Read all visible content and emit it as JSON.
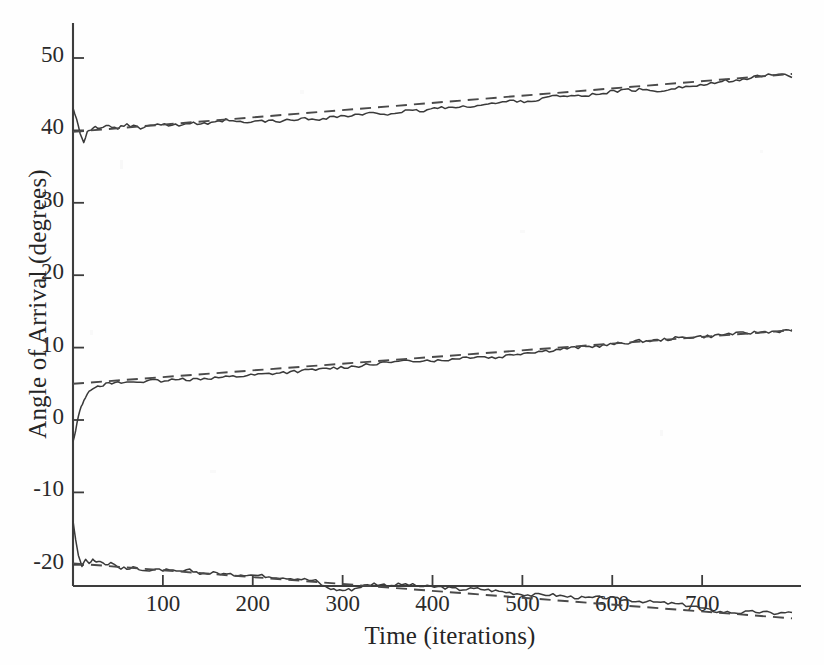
{
  "chart_data": {
    "type": "line",
    "title": "",
    "xlabel": "Time (iterations)",
    "ylabel": "Angle of Arrival (degrees)",
    "xlim": [
      0,
      810
    ],
    "ylim": [
      -30,
      54
    ],
    "grid": false,
    "legend": "none",
    "xticks": [
      100,
      200,
      300,
      400,
      500,
      600,
      700
    ],
    "yticks": [
      50,
      40,
      30,
      20,
      10,
      0,
      -10,
      -20
    ],
    "series": [
      {
        "name": "source-1-estimate",
        "style": "solid",
        "color": "#3a3a3a",
        "x": [
          0,
          4,
          8,
          12,
          16,
          20,
          25,
          30,
          40,
          50,
          60,
          75,
          90,
          110,
          130,
          150,
          170,
          190,
          210,
          230,
          250,
          270,
          290,
          310,
          330,
          350,
          370,
          390,
          410,
          430,
          450,
          470,
          490,
          510,
          530,
          550,
          570,
          590,
          610,
          630,
          650,
          670,
          690,
          710,
          730,
          750,
          770,
          785,
          800
        ],
        "y": [
          43.0,
          41.6,
          39.6,
          38.4,
          39.8,
          40.0,
          40.5,
          40.2,
          40.6,
          40.3,
          40.8,
          40.4,
          40.9,
          40.7,
          41.0,
          40.8,
          41.4,
          41.0,
          41.3,
          41.2,
          41.6,
          41.5,
          41.9,
          42.0,
          42.3,
          42.3,
          42.6,
          42.7,
          43.2,
          43.1,
          43.5,
          43.7,
          44.1,
          44.0,
          44.6,
          44.9,
          44.7,
          45.2,
          45.5,
          45.6,
          45.4,
          45.9,
          46.1,
          46.4,
          46.9,
          47.1,
          47.6,
          47.9,
          47.3
        ]
      },
      {
        "name": "source-1-trend",
        "style": "dashed",
        "color": "#4a4a4a",
        "x": [
          0,
          800
        ],
        "y": [
          39.8,
          47.8
        ]
      },
      {
        "name": "source-2-estimate",
        "style": "solid",
        "color": "#3a3a3a",
        "x": [
          0,
          3,
          6,
          9,
          12,
          16,
          20,
          25,
          30,
          40,
          50,
          60,
          75,
          90,
          110,
          130,
          150,
          170,
          190,
          210,
          230,
          250,
          270,
          290,
          310,
          330,
          350,
          370,
          390,
          410,
          430,
          450,
          470,
          490,
          510,
          530,
          550,
          570,
          590,
          610,
          630,
          650,
          670,
          690,
          710,
          730,
          750,
          770,
          790,
          800
        ],
        "y": [
          -3.0,
          -1.5,
          0.6,
          1.8,
          2.7,
          3.6,
          4.2,
          4.6,
          4.8,
          5.0,
          5.1,
          5.2,
          5.3,
          5.4,
          5.5,
          5.6,
          5.8,
          5.9,
          6.1,
          6.3,
          6.5,
          6.7,
          6.9,
          7.2,
          7.4,
          7.6,
          7.9,
          8.1,
          8.3,
          8.2,
          8.6,
          8.8,
          8.6,
          9.1,
          9.4,
          9.6,
          9.9,
          10.1,
          10.3,
          10.6,
          10.9,
          11.0,
          11.3,
          11.5,
          11.6,
          11.9,
          12.0,
          12.2,
          12.3,
          12.3
        ]
      },
      {
        "name": "source-2-trend",
        "style": "dashed",
        "color": "#4a4a4a",
        "x": [
          0,
          800
        ],
        "y": [
          5.0,
          12.4
        ]
      },
      {
        "name": "source-3-estimate",
        "style": "solid",
        "color": "#3a3a3a",
        "x": [
          0,
          3,
          6,
          10,
          14,
          18,
          22,
          26,
          30,
          36,
          42,
          50,
          60,
          70,
          85,
          100,
          115,
          130,
          145,
          160,
          175,
          190,
          210,
          230,
          250,
          270,
          280,
          290,
          300,
          310,
          320,
          335,
          350,
          370,
          390,
          410,
          430,
          450,
          470,
          490,
          510,
          530,
          550,
          570,
          590,
          610,
          630,
          650,
          670,
          690,
          705,
          720,
          740,
          760,
          780,
          800
        ],
        "y": [
          -14.0,
          -16.5,
          -18.6,
          -20.2,
          -19.3,
          -19.8,
          -19.2,
          -19.6,
          -19.4,
          -20.0,
          -19.7,
          -20.3,
          -20.6,
          -20.4,
          -20.8,
          -20.7,
          -21.0,
          -20.8,
          -21.2,
          -21.1,
          -21.4,
          -21.3,
          -21.5,
          -21.7,
          -21.9,
          -22.2,
          -23.0,
          -23.4,
          -23.5,
          -23.4,
          -23.0,
          -22.6,
          -22.8,
          -22.7,
          -23.0,
          -23.1,
          -23.4,
          -23.3,
          -23.6,
          -23.9,
          -24.2,
          -24.1,
          -24.4,
          -24.6,
          -24.5,
          -24.8,
          -25.0,
          -25.2,
          -25.4,
          -25.7,
          -26.2,
          -26.5,
          -26.6,
          -26.5,
          -26.7,
          -26.6
        ]
      },
      {
        "name": "source-3-trend",
        "style": "dashed",
        "color": "#4a4a4a",
        "x": [
          0,
          800
        ],
        "y": [
          -19.8,
          -27.4
        ]
      }
    ]
  },
  "axes": {
    "x_tick_labels": [
      "100",
      "200",
      "300",
      "400",
      "500",
      "600",
      "700"
    ],
    "y_tick_labels": [
      "50",
      "40",
      "30",
      "20",
      "10",
      "0",
      "-10",
      "-20"
    ],
    "x_axis_label": "Time (iterations)",
    "y_axis_label": "Angle of Arrival (degrees)"
  },
  "colors": {
    "axis": "#3d3d3d",
    "data_solid": "#3a3a3a",
    "data_dashed": "#4a4a4a",
    "background": "#fefefe"
  }
}
